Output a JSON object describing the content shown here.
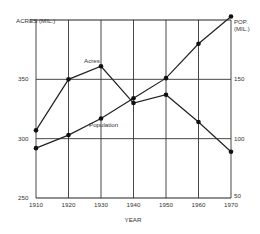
{
  "chart_data": {
    "type": "line",
    "title": "",
    "xlabel": "YEAR",
    "ylabel_left": "ACRES (MIL.)",
    "ylabel_right": "POP. (MIL.)",
    "x": [
      1910,
      1920,
      1930,
      1940,
      1950,
      1960,
      1970
    ],
    "x_tick_labels": [
      "1910",
      "1920",
      "1930",
      "1940",
      "1950",
      "1960",
      "1970"
    ],
    "y_left_ticks": [
      "250",
      "300",
      "350"
    ],
    "y_right_ticks": [
      "50",
      "100",
      "150"
    ],
    "ylim_left": [
      250,
      400
    ],
    "ylim_right": [
      50,
      200
    ],
    "grid": true,
    "legend": "inline labels",
    "series": [
      {
        "name": "Acres",
        "axis": "left",
        "values": [
          307,
          350,
          361,
          330,
          337,
          314,
          289
        ]
      },
      {
        "name": "Population",
        "axis": "right",
        "values": [
          92,
          103,
          117,
          134,
          151,
          180,
          203
        ]
      }
    ],
    "annotations": [
      "Acres",
      "Population"
    ]
  }
}
